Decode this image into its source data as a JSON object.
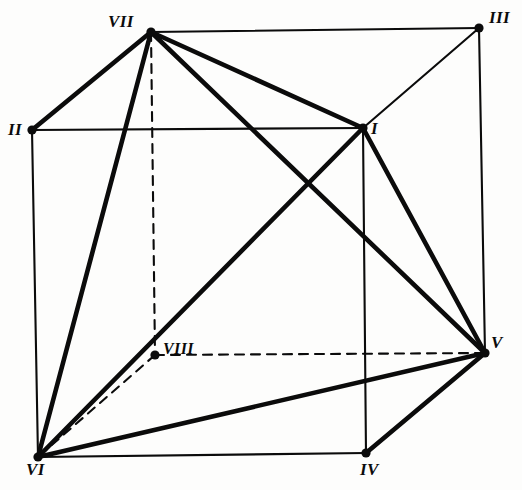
{
  "figure": {
    "type": "geometric-diagram",
    "width": 522,
    "height": 490,
    "background_color": "#fdfdfc",
    "ink_color": "#0b0b0b"
  },
  "vertices": [
    {
      "id": "I",
      "label": "I",
      "x": 363,
      "y": 128,
      "label_x": 371,
      "label_y": 120,
      "dot": true,
      "role": "front-top-right"
    },
    {
      "id": "II",
      "label": "II",
      "x": 32,
      "y": 130,
      "label_x": 8,
      "label_y": 121,
      "dot": true,
      "role": "front-top-left"
    },
    {
      "id": "III",
      "label": "III",
      "x": 479,
      "y": 28,
      "label_x": 489,
      "label_y": 9,
      "dot": true,
      "role": "back-top-right"
    },
    {
      "id": "IV",
      "label": "IV",
      "x": 366,
      "y": 453,
      "label_x": 360,
      "label_y": 461,
      "dot": true,
      "role": "front-bottom-right"
    },
    {
      "id": "V",
      "label": "V",
      "x": 485,
      "y": 353,
      "label_x": 491,
      "label_y": 334,
      "dot": true,
      "role": "back-bottom-right"
    },
    {
      "id": "VI",
      "label": "VI",
      "x": 38,
      "y": 457,
      "label_x": 26,
      "label_y": 461,
      "dot": true,
      "role": "front-bottom-left"
    },
    {
      "id": "VII",
      "label": "VII",
      "x": 151,
      "y": 32,
      "label_x": 108,
      "label_y": 13,
      "dot": true,
      "role": "back-top-left"
    },
    {
      "id": "VIII",
      "label": "VIII",
      "x": 155,
      "y": 355,
      "label_x": 163,
      "label_y": 341,
      "dot": true,
      "role": "back-bottom-left"
    }
  ],
  "edges": [
    {
      "from": "VII",
      "to": "III",
      "style": "solid",
      "weight": "thin",
      "kind": "cube-edge"
    },
    {
      "from": "VII",
      "to": "II",
      "style": "solid",
      "weight": "thick",
      "kind": "cube-edge"
    },
    {
      "from": "II",
      "to": "I",
      "style": "solid",
      "weight": "thin",
      "kind": "cube-edge"
    },
    {
      "from": "III",
      "to": "I",
      "style": "solid",
      "weight": "thin",
      "kind": "cube-edge"
    },
    {
      "from": "II",
      "to": "VI",
      "style": "solid",
      "weight": "thin",
      "kind": "cube-edge"
    },
    {
      "from": "III",
      "to": "V",
      "style": "solid",
      "weight": "thin",
      "kind": "cube-edge"
    },
    {
      "from": "I",
      "to": "IV",
      "style": "solid",
      "weight": "thin",
      "kind": "cube-edge"
    },
    {
      "from": "VI",
      "to": "IV",
      "style": "solid",
      "weight": "thin",
      "kind": "cube-edge"
    },
    {
      "from": "IV",
      "to": "V",
      "style": "solid",
      "weight": "thick",
      "kind": "cube-edge"
    },
    {
      "from": "VII",
      "to": "VIII",
      "style": "dashed",
      "weight": "thin",
      "kind": "hidden-edge"
    },
    {
      "from": "VIII",
      "to": "V",
      "style": "dashed",
      "weight": "thin",
      "kind": "hidden-edge"
    },
    {
      "from": "VIII",
      "to": "VI",
      "style": "dashed",
      "weight": "thin",
      "kind": "hidden-edge"
    },
    {
      "from": "VII",
      "to": "I",
      "style": "solid",
      "weight": "thick",
      "kind": "face-diagonal"
    },
    {
      "from": "VII",
      "to": "VI",
      "style": "solid",
      "weight": "thick",
      "kind": "face-diagonal"
    },
    {
      "from": "VII",
      "to": "V",
      "style": "solid",
      "weight": "thick",
      "kind": "space-diagonal"
    },
    {
      "from": "I",
      "to": "VI",
      "style": "solid",
      "weight": "thick",
      "kind": "space-diagonal"
    },
    {
      "from": "I",
      "to": "V",
      "style": "solid",
      "weight": "thick",
      "kind": "face-diagonal"
    },
    {
      "from": "VI",
      "to": "V",
      "style": "solid",
      "weight": "thick",
      "kind": "face-diagonal"
    }
  ],
  "stroke": {
    "thin_width": 2.1,
    "thick_width": 4.6,
    "dash_pattern": "9 7",
    "dot_radius": 4.6
  }
}
